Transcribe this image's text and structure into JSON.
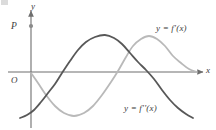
{
  "figure": {
    "kind": "math-graph",
    "width": 216,
    "height": 130,
    "background": "#ffffff"
  },
  "axes": {
    "y_label": "y",
    "x_label": "x",
    "origin_label": "O",
    "axis_color": "#6e6e6e",
    "origin_px": {
      "x": 31,
      "y": 72
    },
    "x_axis_from_px": {
      "x": 8,
      "y": 72
    },
    "x_axis_to_px": {
      "x": 203,
      "y": 72
    },
    "y_axis_from_px": {
      "x": 31,
      "y": 128
    },
    "y_axis_to_px": {
      "x": 31,
      "y": 11
    },
    "arrows": [
      "y-axis-top",
      "x-axis-right"
    ]
  },
  "points": [
    {
      "label": "P",
      "on_axis": "y",
      "px": {
        "x": 31,
        "y": 26
      },
      "marker_color": "#8a8a8a",
      "marker_radius": 2.1
    }
  ],
  "chart_data": {
    "type": "line",
    "title": "",
    "xlabel": "x",
    "ylabel": "y",
    "grid": false,
    "legend": "inline-curve-labels",
    "axis_origin": {
      "x": 31,
      "y": 72
    },
    "series": [
      {
        "name": "y = f'(x)",
        "label": "y = f'(x)",
        "color": "#b9b9b9",
        "stroke_width": 1.8,
        "label_px": {
          "x": 156,
          "y": 24
        },
        "description": "lighter sinusoid; starts near the origin on the y-axis, dips to a minimum near x=75, rises through the x-axis near x=117, peaks near x=133, falls back to the x-axis near x=197",
        "points_px": [
          [
            31,
            73
          ],
          [
            38,
            83
          ],
          [
            46,
            95
          ],
          [
            55,
            106
          ],
          [
            64,
            113
          ],
          [
            74,
            116
          ],
          [
            84,
            113
          ],
          [
            93,
            106
          ],
          [
            102,
            95
          ],
          [
            111,
            82
          ],
          [
            118,
            71
          ],
          [
            126,
            57
          ],
          [
            133,
            46
          ],
          [
            141,
            39
          ],
          [
            149,
            36
          ],
          [
            157,
            39
          ],
          [
            165,
            46
          ],
          [
            173,
            56
          ],
          [
            181,
            63
          ],
          [
            189,
            69
          ],
          [
            197,
            72
          ]
        ]
      },
      {
        "name": "y = f''(x)",
        "label": "y = f''(x)",
        "color": "#585858",
        "stroke_width": 1.8,
        "label_px": {
          "x": 124,
          "y": 104
        },
        "description": "darker sinusoid; begins low at the left edge near y=118, rises through the x-axis near x=62, peaks near x=105, falls through the x-axis near x=152, ends low near y=118 at the right edge",
        "points_px": [
          [
            20,
            118
          ],
          [
            27,
            115
          ],
          [
            34,
            110
          ],
          [
            41,
            102
          ],
          [
            48,
            93
          ],
          [
            55,
            84
          ],
          [
            62,
            73
          ],
          [
            70,
            61
          ],
          [
            78,
            50
          ],
          [
            86,
            42
          ],
          [
            95,
            37
          ],
          [
            105,
            35
          ],
          [
            114,
            38
          ],
          [
            122,
            44
          ],
          [
            130,
            53
          ],
          [
            138,
            62
          ],
          [
            146,
            70
          ],
          [
            154,
            79
          ],
          [
            162,
            90
          ],
          [
            170,
            100
          ],
          [
            178,
            108
          ],
          [
            186,
            114
          ],
          [
            193,
            118
          ]
        ]
      }
    ]
  }
}
